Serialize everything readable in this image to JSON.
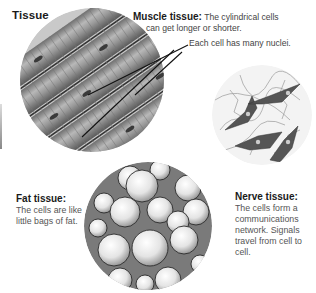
{
  "title": "Tissue",
  "muscle": {
    "label": "Muscle tissue:",
    "description_line1": "The cylindrical cells",
    "description_line2": "can get longer or shorter.",
    "pointer_caption": "Each cell has many nuclei."
  },
  "fat": {
    "label": "Fat tissue:",
    "description": "The cells are like little bags of fat."
  },
  "nerve": {
    "label": "Nerve tissue:",
    "description": "The cells form a communications network. Signals travel from cell to cell."
  },
  "colors": {
    "text_bold": "#1a1a1a",
    "text_body": "#555555",
    "illustration_gray": "#8a8a8a"
  }
}
